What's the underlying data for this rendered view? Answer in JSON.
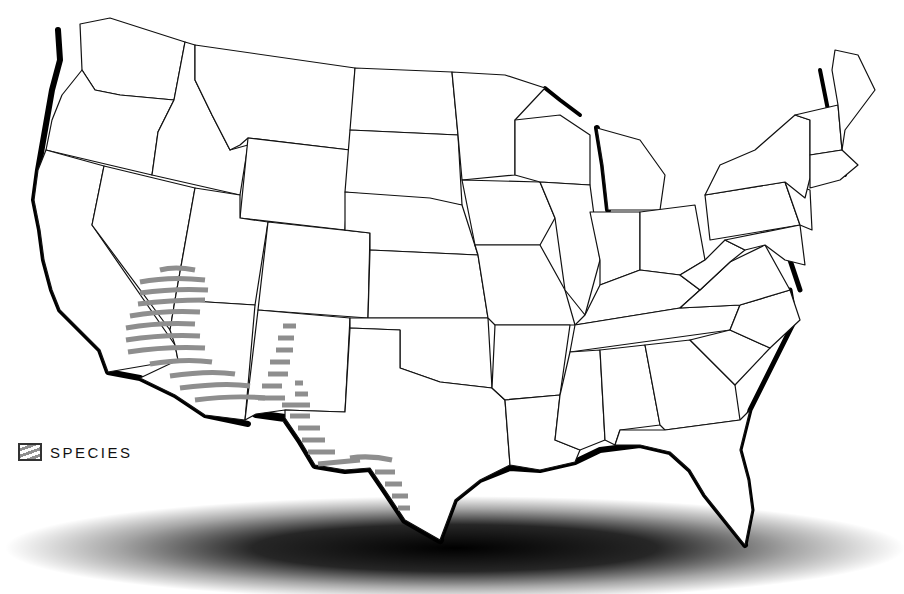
{
  "map": {
    "title": "",
    "region": "Contiguous United States",
    "background_color": "#ffffff",
    "state_fill": "#ffffff",
    "border_color": "#111111",
    "coast_shadow_color": "#000000",
    "ground_shadow": true
  },
  "legend": {
    "items": [
      {
        "label": "SPECIES",
        "pattern": "gray-stripes",
        "color": "#8e8e8e"
      }
    ]
  },
  "species_range": {
    "label": "SPECIES",
    "regions": [
      "Southern Nevada / SE California",
      "Western Arizona",
      "Eastern New Mexico",
      "West Texas"
    ],
    "color": "#8e8e8e"
  }
}
